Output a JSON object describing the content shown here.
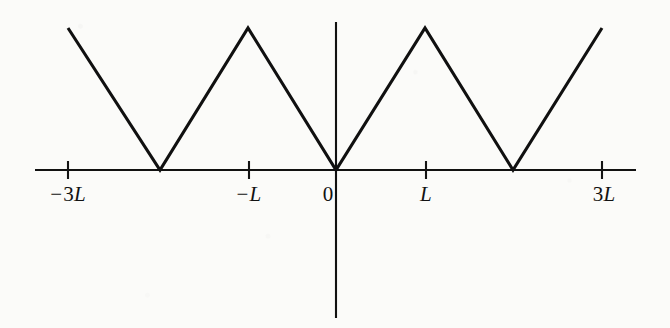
{
  "figure": {
    "background_color": "#fbfbf9",
    "ink_color": "#111111"
  },
  "axes": {
    "x_axis_name": "horizontal-axis",
    "y_axis_name": "vertical-axis",
    "x_axis": {
      "y_px": 170,
      "x_start_px": 35,
      "x_end_px": 636,
      "stroke_width": 2.1
    },
    "y_axis": {
      "x_px": 336,
      "y_start_px": 22,
      "y_end_px": 318,
      "stroke_width": 2.1
    },
    "tick_half_length_px": 9,
    "origin_px": {
      "x": 336,
      "y": 170
    },
    "units_per_px": 44.3
  },
  "ticks": [
    {
      "name": "tick-minus-3L",
      "x_px": 68,
      "value": -3,
      "sign": "−",
      "number": "3",
      "variable": "L",
      "label": "−3L",
      "label_x_px": 68,
      "label_y_px": 182
    },
    {
      "name": "tick-minus-L",
      "x_px": 249,
      "value": -1,
      "sign": "−",
      "number": "",
      "variable": "L",
      "label": "−L",
      "label_x_px": 249,
      "label_y_px": 182
    },
    {
      "name": "tick-zero",
      "x_px": 336,
      "value": 0,
      "sign": "",
      "number": "0",
      "variable": "",
      "label": "0",
      "label_x_px": 328,
      "label_y_px": 182
    },
    {
      "name": "tick-L",
      "x_px": 426,
      "value": 1,
      "sign": "",
      "number": "",
      "variable": "L",
      "label": "L",
      "label_x_px": 426,
      "label_y_px": 182
    },
    {
      "name": "tick-3L",
      "x_px": 602,
      "value": 3,
      "sign": "",
      "number": "3",
      "variable": "L",
      "label": "3L",
      "label_x_px": 604,
      "label_y_px": 182
    }
  ],
  "curve": {
    "name": "triangular-wave",
    "stroke_width": 3.1,
    "points_px": "68,28 160,170 248,28 336,170 425,28 513,170 602,28"
  },
  "chart_data": {
    "type": "line",
    "title": "",
    "xlabel": "",
    "ylabel": "",
    "x": [
      -3,
      -2,
      -1,
      0,
      1,
      2,
      3
    ],
    "y": [
      1,
      0,
      1,
      0,
      1,
      0,
      1
    ],
    "x_tick_values": [
      -3,
      -1,
      0,
      1,
      3
    ],
    "x_tick_labels": [
      "−3L",
      "−L",
      "0",
      "L",
      "3L"
    ],
    "y_tick_values": [],
    "y_tick_labels": [],
    "xlim": [
      -3.4,
      3.4
    ],
    "ylim": [
      -3.3,
      1.15
    ],
    "grid": false,
    "legend": null,
    "series": [
      {
        "name": "f(x) = periodic |x|",
        "x": [
          -3,
          -2,
          -1,
          0,
          1,
          2,
          3
        ],
        "values": [
          1,
          0,
          1,
          0,
          1,
          0,
          1
        ]
      }
    ],
    "annotations": []
  }
}
